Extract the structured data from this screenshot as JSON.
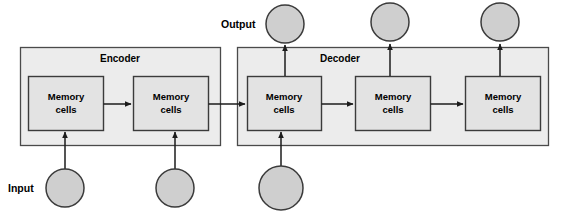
{
  "diagram": {
    "labels": {
      "input": "Input",
      "output": "Output",
      "encoder": "Encoder",
      "decoder": "Decoder",
      "memory_line1": "Memory",
      "memory_line2": "cells"
    },
    "colors": {
      "panel_fill": "#ececec",
      "cell_fill": "#e3e3e3",
      "node_fill": "#cfcfcf",
      "stroke": "#3b3b3b",
      "text": "#000000",
      "background": "#ffffff"
    },
    "sections": [
      {
        "name": "encoder",
        "label": "Encoder",
        "x": 20,
        "y": 47,
        "width": 200,
        "height": 98,
        "cells": [
          {
            "id": "enc-cell-1",
            "x": 28,
            "y": 76,
            "width": 75,
            "height": 54,
            "line1": "Memory",
            "line2": "cells"
          },
          {
            "id": "enc-cell-2",
            "x": 133,
            "y": 76,
            "width": 75,
            "height": 54,
            "line1": "Memory",
            "line2": "cells"
          }
        ]
      },
      {
        "name": "decoder",
        "label": "Decoder",
        "x": 237,
        "y": 47,
        "width": 311,
        "height": 98,
        "cells": [
          {
            "id": "dec-cell-1",
            "x": 247,
            "y": 76,
            "width": 74,
            "height": 54,
            "line1": "Memory",
            "line2": "cells"
          },
          {
            "id": "dec-cell-2",
            "x": 355,
            "y": 76,
            "width": 75,
            "height": 54,
            "line1": "Memory",
            "line2": "cells"
          },
          {
            "id": "dec-cell-3",
            "x": 465,
            "y": 76,
            "width": 75,
            "height": 54,
            "line1": "Memory",
            "line2": "cells"
          }
        ]
      }
    ],
    "input_nodes": [
      {
        "id": "input-node-1",
        "cx": 65,
        "cy": 188,
        "r": 19,
        "labeled": true
      },
      {
        "id": "input-node-2",
        "cx": 175,
        "cy": 188,
        "r": 19,
        "labeled": false
      },
      {
        "id": "input-node-3",
        "cx": 281,
        "cy": 188,
        "r": 22,
        "labeled": false
      }
    ],
    "output_nodes": [
      {
        "id": "output-node-1",
        "cx": 285,
        "cy": 24,
        "r": 19,
        "labeled": true
      },
      {
        "id": "output-node-2",
        "cx": 390,
        "cy": 22,
        "r": 19,
        "labeled": false
      },
      {
        "id": "output-node-3",
        "cx": 500,
        "cy": 22,
        "r": 19,
        "labeled": false
      }
    ],
    "label_positions": {
      "input": {
        "x": 8,
        "y": 192
      },
      "output": {
        "x": 221,
        "y": 28
      }
    },
    "flow_arrows": [
      {
        "id": "enc1-to-enc2",
        "from": "enc-cell-1",
        "to": "enc-cell-2",
        "direction": "right"
      },
      {
        "id": "enc2-to-dec1",
        "from": "enc-cell-2",
        "to": "dec-cell-1",
        "direction": "right"
      },
      {
        "id": "dec1-to-dec2",
        "from": "dec-cell-1",
        "to": "dec-cell-2",
        "direction": "right"
      },
      {
        "id": "dec2-to-dec3",
        "from": "dec-cell-2",
        "to": "dec-cell-3",
        "direction": "right"
      },
      {
        "id": "input1-to-enc1",
        "from": "input-node-1",
        "to": "enc-cell-1",
        "direction": "up"
      },
      {
        "id": "input2-to-enc2",
        "from": "input-node-2",
        "to": "enc-cell-2",
        "direction": "up"
      },
      {
        "id": "input3-to-dec1",
        "from": "input-node-3",
        "to": "dec-cell-1",
        "direction": "up"
      },
      {
        "id": "dec1-to-output1",
        "from": "dec-cell-1",
        "to": "output-node-1",
        "direction": "up"
      },
      {
        "id": "dec2-to-output2",
        "from": "dec-cell-2",
        "to": "output-node-2",
        "direction": "up"
      },
      {
        "id": "dec3-to-output3",
        "from": "dec-cell-3",
        "to": "output-node-3",
        "direction": "up"
      }
    ]
  }
}
